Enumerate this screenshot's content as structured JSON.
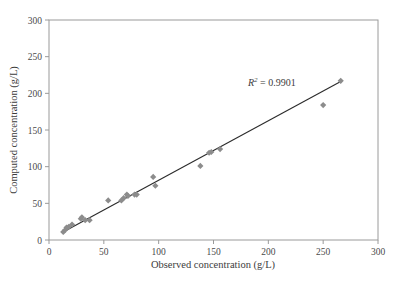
{
  "chart_data": {
    "type": "scatter",
    "title": "",
    "xlabel": "Observed concentration (g/L)",
    "ylabel": "Computed concentration (g/L)",
    "xlim": [
      0,
      300
    ],
    "ylim": [
      0,
      300
    ],
    "xticks": [
      0,
      50,
      100,
      150,
      200,
      250,
      300
    ],
    "yticks": [
      0,
      50,
      100,
      150,
      200,
      250,
      300
    ],
    "xtick_labels": [
      "0",
      "50",
      "100",
      "150",
      "200",
      "250",
      "300"
    ],
    "ytick_labels": [
      "0",
      "50",
      "100",
      "150",
      "200",
      "250",
      "300"
    ],
    "grid": false,
    "legend": null,
    "marker": "diamond",
    "marker_color": "#8c8c8c",
    "line_color": "#2b2b2b",
    "frame_color": "#9a9a9a",
    "series": [
      {
        "name": "Observed vs computed concentration",
        "points": [
          [
            13,
            11
          ],
          [
            15,
            14
          ],
          [
            16,
            17
          ],
          [
            18,
            18
          ],
          [
            21,
            21
          ],
          [
            29,
            29
          ],
          [
            30,
            31
          ],
          [
            33,
            27
          ],
          [
            37,
            27
          ],
          [
            54,
            54
          ],
          [
            66,
            54
          ],
          [
            68,
            57
          ],
          [
            71,
            62
          ],
          [
            72,
            60
          ],
          [
            78,
            62
          ],
          [
            80,
            62
          ],
          [
            95,
            86
          ],
          [
            97,
            74
          ],
          [
            138,
            101
          ],
          [
            146,
            119
          ],
          [
            148,
            120
          ],
          [
            156,
            124
          ],
          [
            250,
            184
          ],
          [
            266,
            217
          ]
        ]
      }
    ],
    "fit_line": {
      "x_start": 13,
      "y_start": 11,
      "x_end": 266,
      "y_end": 216
    },
    "annotations": [
      {
        "name": "r-squared",
        "symbol": "R",
        "exponent": "2",
        "equals": "=",
        "value": "0.9901",
        "text": "R2 = 0.9901",
        "x": 205,
        "y": 228
      }
    ]
  }
}
